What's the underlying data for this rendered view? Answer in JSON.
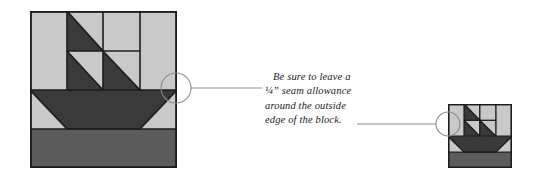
{
  "figure": {
    "kind": "quilting-block-diagram",
    "background_color": "#ffffff",
    "annotation": {
      "lines": [
        "Be sure to leave a",
        "¼” seam allowance",
        "around the outside",
        "edge of the block."
      ],
      "full_text": "Be sure to leave a ¼” seam allowance around the outside edge of the block.",
      "text_color": "#1a1a1a",
      "style": "italic serif"
    },
    "palette": {
      "dark_fabric": "#3a3a3a",
      "medium_fabric": "#5c5c5c",
      "light_fabric": "#c9c9c9",
      "outline": "#1c1c1c",
      "leader_line": "#8a8a96",
      "circle_stroke": "#8a8a96"
    },
    "callouts": [
      {
        "name": "large-block-callout",
        "target": "top-right corner of sail unit of large block",
        "circle": {
          "cx": 176,
          "cy": 88,
          "r": 15
        },
        "leader": {
          "x1": 191,
          "y1": 88,
          "x2": 262,
          "y2": 88
        }
      },
      {
        "name": "small-block-callout",
        "target": "left edge of small block",
        "circle": {
          "cx": 448,
          "cy": 124,
          "r": 12
        },
        "leader": {
          "x1": 357,
          "y1": 124,
          "x2": 436,
          "y2": 124
        }
      }
    ],
    "blocks": [
      {
        "name": "large-sailboat-block",
        "label": "Sailboat quilt block (large)",
        "x": 30,
        "y": 11,
        "width": 147,
        "height": 157,
        "grid": "4x4",
        "units": [
          {
            "id": "sky-left-top",
            "fabric": "light"
          },
          {
            "id": "sail-top-inner",
            "fabric": "dark-triangle"
          },
          {
            "id": "sky-top-3",
            "fabric": "light"
          },
          {
            "id": "sky-right-top",
            "fabric": "light"
          },
          {
            "id": "sail-mid-left",
            "fabric": "dark-triangle"
          },
          {
            "id": "sail-mid-right",
            "fabric": "dark-triangle"
          },
          {
            "id": "hull",
            "fabric": "dark-trapezoid"
          },
          {
            "id": "water",
            "fabric": "medium-band"
          }
        ]
      },
      {
        "name": "small-sailboat-block",
        "label": "Sailboat quilt block (small)",
        "x": 448,
        "y": 104,
        "width": 64,
        "height": 64,
        "grid": "4x4"
      }
    ]
  }
}
